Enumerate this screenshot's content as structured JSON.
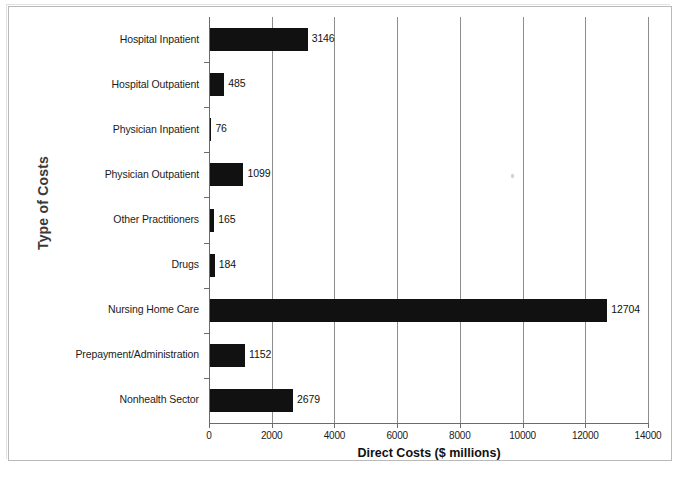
{
  "chart_data": {
    "type": "bar",
    "orientation": "horizontal",
    "title": "",
    "xlabel": "Direct Costs ($ millions)",
    "ylabel": "Type of Costs",
    "categories": [
      "Hospital Inpatient",
      "Hospital Outpatient",
      "Physician Inpatient",
      "Physician Outpatient",
      "Other Practitioners",
      "Drugs",
      "Nursing Home Care",
      "Prepayment/Administration",
      "Nonhealth Sector"
    ],
    "values": [
      3146,
      485,
      76,
      1099,
      165,
      184,
      12704,
      1152,
      2679
    ],
    "data_labels": [
      "3146",
      "485",
      "76",
      "1099",
      "165",
      "184",
      "12704",
      "1152",
      "2679"
    ],
    "xlim": [
      0,
      14000
    ],
    "xticks": [
      0,
      2000,
      4000,
      6000,
      8000,
      10000,
      12000,
      14000
    ],
    "xtick_labels": [
      "0",
      "2000",
      "4000",
      "6000",
      "8000",
      "10000",
      "12000",
      "14000"
    ],
    "grid": "vertical",
    "legend": "none",
    "bar_color": "#111111",
    "gridline_color": "#8d8d8d",
    "axis_color": "#6b6b6b"
  }
}
